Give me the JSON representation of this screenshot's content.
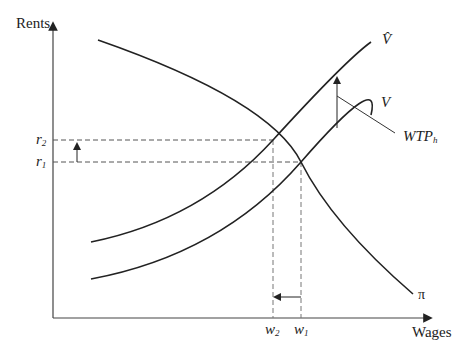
{
  "axes": {
    "y_label": "Rents",
    "x_label": "Wages"
  },
  "curves": {
    "v_hat": {
      "label": "V̂",
      "name": "V-hat"
    },
    "v": {
      "label": "V"
    },
    "pi": {
      "label": "π"
    }
  },
  "ticks": {
    "r2": {
      "base": "r",
      "sub": "2"
    },
    "r1": {
      "base": "r",
      "sub": "1"
    },
    "w2": {
      "base": "w",
      "sub": "2"
    },
    "w1": {
      "base": "w",
      "sub": "1"
    }
  },
  "annotation": {
    "base": "WTP",
    "sub": "h"
  },
  "colors": {
    "line": "#222222",
    "dash": "#555555",
    "background": "#ffffff"
  }
}
